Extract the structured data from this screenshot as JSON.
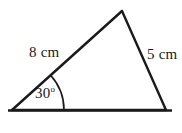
{
  "figure": {
    "type": "triangle-diagram",
    "background_color": "#ffffff",
    "stroke_color": "#1a1a1a",
    "labels": {
      "side_left": "8 cm",
      "side_right": "5 cm",
      "angle_value": "30",
      "angle_unit": "o"
    },
    "geometry": {
      "vertices": {
        "left": [
          12,
          110
        ],
        "apex": [
          122,
          11
        ],
        "right": [
          166,
          110
        ]
      },
      "baseline_extent": [
        8,
        172
      ],
      "baseline_y": 110,
      "angle_arc_radius": 52,
      "angle_arc_start_deg": 0,
      "angle_arc_end_deg": 42
    }
  }
}
